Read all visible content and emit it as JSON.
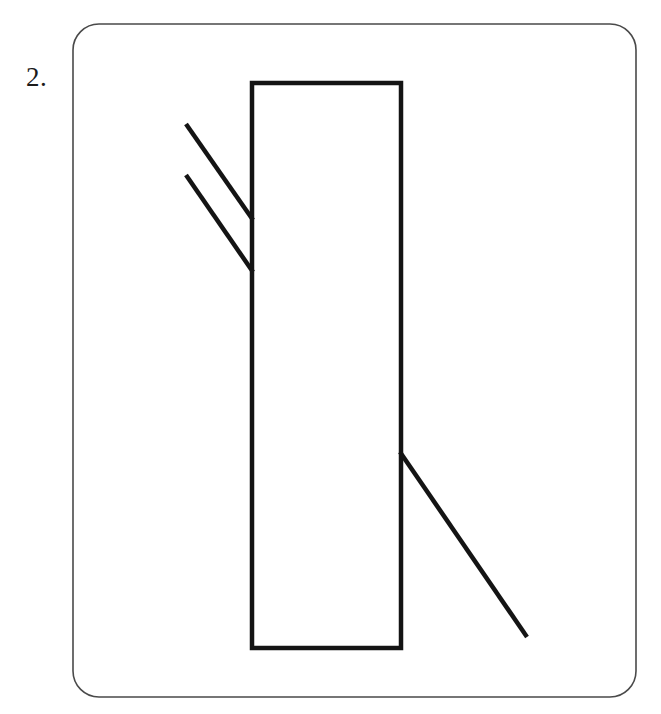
{
  "page": {
    "width": 661,
    "height": 714,
    "background_color": "#ffffff"
  },
  "label": {
    "text": "2.",
    "color": "#1b1b1b",
    "font_size_px": 27
  },
  "frame": {
    "name": "rounded-card-border",
    "x": 73,
    "y": 24,
    "width": 563,
    "height": 673,
    "corner_radius": 26,
    "stroke_color": "#4a4a4a",
    "stroke_width": 1.6,
    "fill": "none"
  },
  "figure": {
    "title": "",
    "stroke_color": "#141414",
    "stroke_width": 4.5,
    "shapes": [
      {
        "id": "main-rectangle",
        "type": "rect",
        "x": 252,
        "y": 83,
        "width": 149,
        "height": 565,
        "stroke_color": "#141414",
        "stroke_width": 4.5,
        "fill": "none"
      },
      {
        "id": "upper-diagonal-line-1",
        "type": "line",
        "x1": 186,
        "y1": 124,
        "x2": 253,
        "y2": 220,
        "stroke_color": "#141414",
        "stroke_width": 4.5
      },
      {
        "id": "upper-diagonal-line-2",
        "type": "line",
        "x1": 186,
        "y1": 175,
        "x2": 253,
        "y2": 272,
        "stroke_color": "#141414",
        "stroke_width": 4.5
      },
      {
        "id": "lower-diagonal-line",
        "type": "line",
        "x1": 400,
        "y1": 452,
        "x2": 527,
        "y2": 637,
        "stroke_color": "#141414",
        "stroke_width": 4.5
      }
    ]
  }
}
